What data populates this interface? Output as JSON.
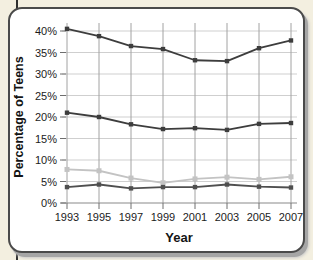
{
  "page": {
    "background_color": "#f3efe0",
    "card_background": "#ffffff",
    "card_border_color": "#4a4a4a",
    "shadow_color": "#a6a6a6"
  },
  "colors": {
    "grid_horizontal": "#cfcfcf",
    "grid_vertical": "#a2a2a2",
    "axis_line": "#8a8a8a",
    "tick": "#6e6e6e",
    "tick_text": "#1b1b1b"
  },
  "chart_data": {
    "type": "line",
    "title": "",
    "xlabel": "Year",
    "ylabel": "Percentage of Teens",
    "x_labels": [
      "1993",
      "1995",
      "1997",
      "1999",
      "2001",
      "2003",
      "2005",
      "2007"
    ],
    "y_tick_labels": [
      "0%",
      "5%",
      "10%",
      "15%",
      "20%",
      "25%",
      "30%",
      "35%",
      "40%"
    ],
    "ylim": [
      0,
      40
    ],
    "ytick_step": 5,
    "grid": true,
    "legend": "none",
    "series": [
      {
        "name": "series-light-gray",
        "color": "#c3c3c3",
        "marker": "square",
        "values": [
          7.8,
          7.5,
          5.8,
          4.7,
          5.6,
          6.0,
          5.5,
          6.1
        ]
      },
      {
        "name": "series-gray-bottom",
        "color": "#4f4f4f",
        "marker": "square",
        "values": [
          3.7,
          4.3,
          3.4,
          3.7,
          3.7,
          4.3,
          3.8,
          3.6
        ]
      },
      {
        "name": "series-dark-middle",
        "color": "#3d3d3d",
        "marker": "square",
        "values": [
          21.0,
          20.0,
          18.3,
          17.2,
          17.4,
          17.0,
          18.4,
          18.6
        ]
      },
      {
        "name": "series-dark-top",
        "color": "#3d3d3d",
        "marker": "square",
        "values": [
          40.5,
          38.8,
          36.5,
          35.8,
          33.2,
          33.0,
          36.0,
          37.8
        ]
      }
    ]
  }
}
